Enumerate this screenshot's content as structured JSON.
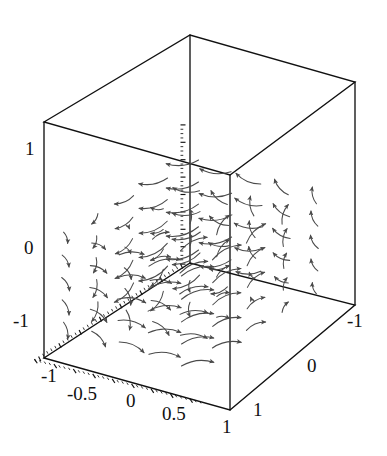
{
  "figure": {
    "kind": "vector-field-3d",
    "background_color": "#ffffff",
    "frame_color": "#111111",
    "arrow_color": "#4a4a4a",
    "caption": ""
  },
  "axes": {
    "x_axis": {
      "name": "x-axis",
      "position": "bottom-front-left",
      "range": [
        -1,
        1
      ],
      "tick_labels": [
        "-1",
        "-0.5",
        "0",
        "0.5",
        "1"
      ],
      "tick_values": [
        -1,
        -0.5,
        0,
        0.5,
        1
      ]
    },
    "y_axis": {
      "name": "y-axis",
      "position": "bottom-front-right",
      "range": [
        -1,
        1
      ],
      "tick_labels": [
        "1",
        "0",
        "-1"
      ],
      "tick_values": [
        1,
        0,
        -1
      ]
    },
    "z_axis": {
      "name": "z-axis",
      "position": "left-vertical",
      "range": [
        -1.2,
        1.2
      ],
      "tick_labels": [
        "1",
        "0",
        "-1"
      ],
      "tick_values": [
        1,
        0,
        -1
      ]
    }
  },
  "labels": {
    "z_top": "1",
    "z_mid": "0",
    "z_bottom": "-1",
    "x_m1": "-1",
    "x_m05": "-0.5",
    "x_0": "0",
    "x_05": "0.5",
    "x_1": "1",
    "y_1": "1",
    "y_0": "0",
    "y_m1": "-1"
  },
  "chart_data": {
    "type": "scatter",
    "title": "",
    "xlabel": "",
    "ylabel": "",
    "zlabel": "",
    "xlim": [
      -1,
      1
    ],
    "ylim": [
      -1,
      1
    ],
    "zlim": [
      -1.2,
      1.2
    ],
    "grid": false,
    "legend": "none",
    "projection": {
      "origin_px": [
        190,
        263
      ],
      "x_unit_px": [
        -73,
        47.5
      ],
      "y_unit_px": [
        82.5,
        21
      ],
      "z_unit_px": [
        0,
        -58
      ]
    },
    "box_corners_px": {
      "front_bottom": [
        230,
        410
      ],
      "left_bottom": [
        44,
        358
      ],
      "right_bottom": [
        355,
        305
      ],
      "back_bottom": [
        190,
        263
      ],
      "front_top": [
        230,
        175
      ],
      "left_top": [
        44,
        122
      ],
      "right_top": [
        355,
        82
      ],
      "back_top": [
        190,
        35
      ]
    },
    "series": [
      {
        "name": "vector-field",
        "arrow_count": 168,
        "field_formula": "F(x,y,z) = (-y, x, sin(z)) style circulation about the vertical axis",
        "arrow_style": "curved-shaft-solid-head"
      }
    ]
  }
}
